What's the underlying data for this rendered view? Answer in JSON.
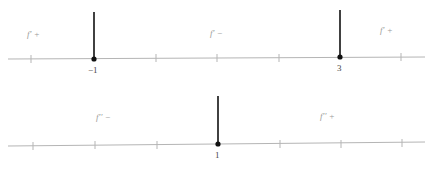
{
  "diagrams": [
    {
      "name": "first-derivative-sign-chart",
      "critical_points": [
        {
          "value": -1,
          "label": "−1"
        },
        {
          "value": 3,
          "label": "3"
        }
      ],
      "regions": [
        {
          "label": "f′ +",
          "sign": "+"
        },
        {
          "label": "f′ −",
          "sign": "-"
        },
        {
          "label": "f′ +",
          "sign": "+"
        }
      ]
    },
    {
      "name": "second-derivative-sign-chart",
      "critical_points": [
        {
          "value": 1,
          "label": "1"
        }
      ],
      "regions": [
        {
          "label": "f′′ −",
          "sign": "-"
        },
        {
          "label": "f′′ +",
          "sign": "+"
        }
      ]
    }
  ],
  "colors": {
    "axis": "#b5b5b5",
    "marker": "#111111",
    "region_text": "#9a9a9a",
    "point_text": "#444444"
  }
}
